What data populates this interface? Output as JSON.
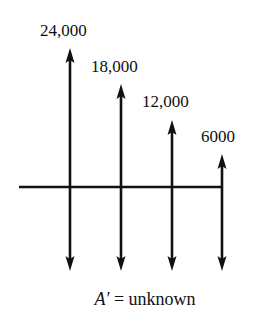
{
  "diagram": {
    "type": "cash-flow",
    "axis": {
      "y": 187,
      "x_start": 19,
      "x_end": 222,
      "color": "#111111"
    },
    "receipts": [
      {
        "label": "24,000",
        "x": 70,
        "tip_y": 48,
        "label_x": 40,
        "label_y": 36
      },
      {
        "label": "18,000",
        "x": 121,
        "tip_y": 84,
        "label_x": 91,
        "label_y": 72
      },
      {
        "label": "12,000",
        "x": 172,
        "tip_y": 120,
        "label_x": 142,
        "label_y": 107
      },
      {
        "label": "6000",
        "x": 222,
        "tip_y": 154,
        "label_x": 201,
        "label_y": 142
      }
    ],
    "payments": [
      {
        "x": 70,
        "tip_y": 271
      },
      {
        "x": 121,
        "tip_y": 271
      },
      {
        "x": 172,
        "tip_y": 271
      },
      {
        "x": 222,
        "tip_y": 271
      }
    ],
    "caption": {
      "symbol": "A′",
      "equals": " = ",
      "text": "unknown"
    }
  }
}
